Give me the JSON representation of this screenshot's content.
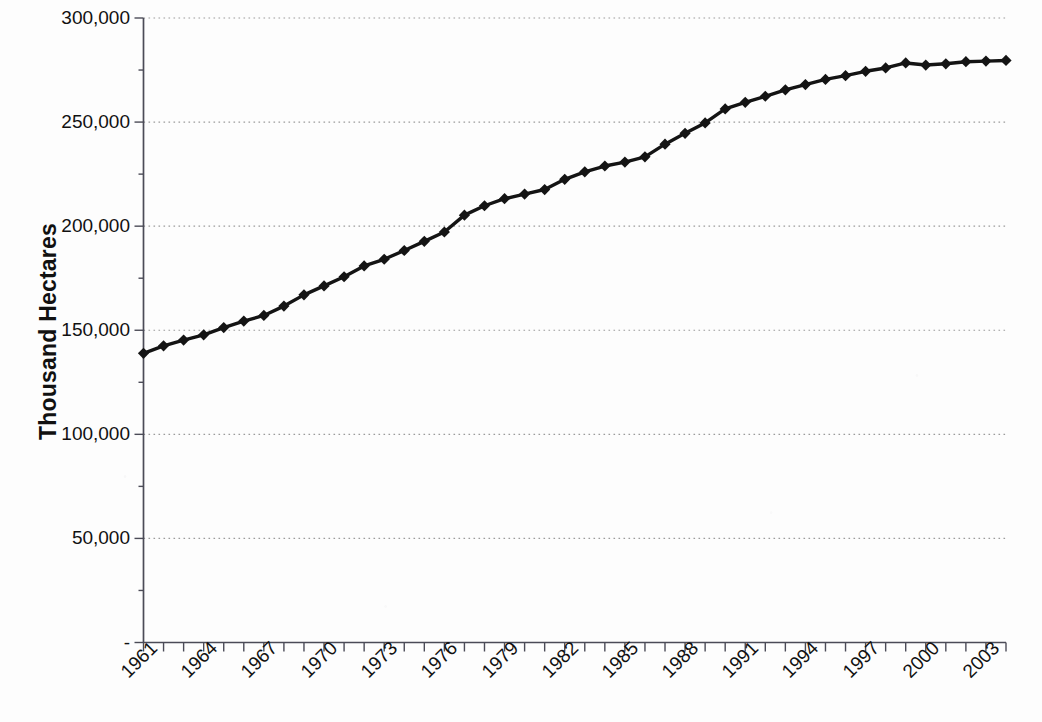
{
  "chart_data": {
    "type": "line",
    "title": "",
    "xlabel": "",
    "ylabel": "Thousand Hectares",
    "ylim": [
      0,
      300000
    ],
    "xlim": [
      1961,
      2004
    ],
    "grid": true,
    "legend": "none",
    "marker": "diamond",
    "series_color": "#141414",
    "gridline_color": "#9b9b9b",
    "axis_color": "#4b4b57",
    "y_ticks": [
      0,
      50000,
      100000,
      150000,
      200000,
      250000,
      300000
    ],
    "y_tick_labels": [
      "-",
      "50,000",
      "100,000",
      "150,000",
      "200,000",
      "250,000",
      "300,000"
    ],
    "x_tick_labels": [
      "1961",
      "1964",
      "1967",
      "1970",
      "1973",
      "1976",
      "1979",
      "1982",
      "1985",
      "1988",
      "1991",
      "1994",
      "1997",
      "2000",
      "2003"
    ],
    "x_tick_label_rotation": -45,
    "x": [
      1961,
      1962,
      1963,
      1964,
      1965,
      1966,
      1967,
      1968,
      1969,
      1970,
      1971,
      1972,
      1973,
      1974,
      1975,
      1976,
      1977,
      1978,
      1979,
      1980,
      1981,
      1982,
      1983,
      1984,
      1985,
      1986,
      1987,
      1988,
      1989,
      1990,
      1991,
      1992,
      1993,
      1994,
      1995,
      1996,
      1997,
      1998,
      1999,
      2000,
      2001,
      2002,
      2003,
      2004
    ],
    "values": [
      138900,
      142500,
      145300,
      147800,
      151300,
      154400,
      157100,
      161600,
      167000,
      171300,
      175700,
      180900,
      184100,
      188300,
      192700,
      197200,
      205300,
      209800,
      213200,
      215400,
      217600,
      222500,
      226100,
      228900,
      230800,
      233300,
      239400,
      244600,
      249600,
      256300,
      259500,
      262400,
      265500,
      268000,
      270500,
      272300,
      274400,
      276000,
      278400,
      277400,
      278000,
      279000,
      279300,
      279600
    ],
    "series_name": "Area"
  },
  "axis": {
    "y_title": "Thousand Hectares"
  }
}
